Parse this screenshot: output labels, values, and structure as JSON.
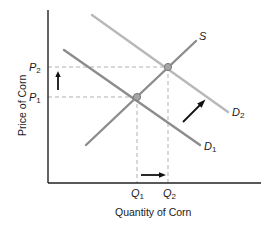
{
  "diagram": {
    "type": "supply-demand",
    "x_axis_label": "Quantity of Corn",
    "y_axis_label": "Price of Corn",
    "price_labels": [
      {
        "main": "P",
        "sub": "2"
      },
      {
        "main": "P",
        "sub": "1"
      }
    ],
    "quantity_labels": [
      {
        "main": "Q",
        "sub": "1"
      },
      {
        "main": "Q",
        "sub": "2"
      }
    ],
    "curves": {
      "supply": {
        "main": "S",
        "sub": ""
      },
      "demand_original": {
        "main": "D",
        "sub": "1"
      },
      "demand_shifted": {
        "main": "D",
        "sub": "2"
      }
    },
    "colors": {
      "axis": "#222222",
      "supply": "#8a8a8a",
      "demand_original": "#8a8a8a",
      "demand_shifted": "#b4b4b4",
      "guide": "#a0a0a0",
      "arrow": "#111111",
      "equilibrium_point": "#9a9a9a"
    }
  }
}
